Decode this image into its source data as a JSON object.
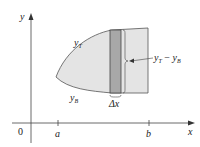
{
  "diagram": {
    "axes": {
      "x_label": "x",
      "y_label": "y",
      "origin_label": "0"
    },
    "ticks": [
      {
        "label": "a",
        "x": 58
      },
      {
        "label": "b",
        "x": 149
      }
    ],
    "curves": {
      "top_label": "y",
      "top_sub": "T",
      "bottom_label": "y",
      "bottom_sub": "B"
    },
    "strip": {
      "width_label": "Δx",
      "height_label_y1": "y",
      "height_label_sub1": "T",
      "height_label_minus": " − ",
      "height_label_y2": "y",
      "height_label_sub2": "B"
    },
    "colors": {
      "region_fill": "#e4e4e4",
      "strip_fill": "#a8a8a8",
      "outline": "#555555",
      "axis": "#444444"
    }
  }
}
